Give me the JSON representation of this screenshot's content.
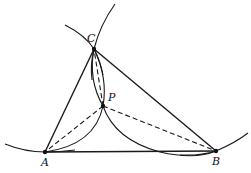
{
  "diagram": {
    "type": "geometric-construction",
    "points": {
      "A": {
        "label": "A",
        "x": 45,
        "y": 152
      },
      "B": {
        "label": "B",
        "x": 216,
        "y": 151
      },
      "C": {
        "label": "C",
        "x": 94,
        "y": 49
      },
      "P": {
        "label": "P",
        "x": 103,
        "y": 106
      }
    },
    "solid_segments": [
      "AB",
      "BC",
      "CA"
    ],
    "dashed_segments": [
      "PA",
      "PB",
      "PC"
    ],
    "labels": {
      "A": "A",
      "B": "B",
      "C": "C",
      "P": "P"
    },
    "colors": {
      "stroke": "#1a1a1a",
      "background": "#ffffff"
    }
  }
}
